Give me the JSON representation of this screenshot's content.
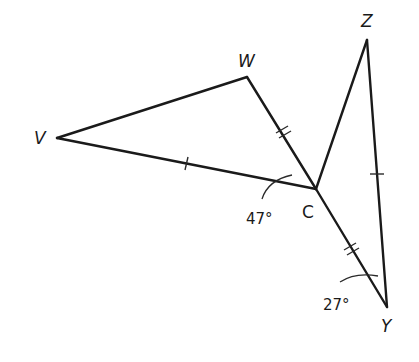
{
  "diagram": {
    "points": {
      "V": {
        "label": "V",
        "x": 57,
        "y": 138,
        "italic": true
      },
      "W": {
        "label": "W",
        "x": 247,
        "y": 77,
        "italic": true
      },
      "C": {
        "label": "C",
        "x": 316,
        "y": 189,
        "italic": false
      },
      "Z": {
        "label": "Z",
        "x": 367,
        "y": 40,
        "italic": true
      },
      "Y": {
        "label": "Y",
        "x": 387,
        "y": 307,
        "italic": true
      }
    },
    "segments": [
      {
        "from": "V",
        "to": "W",
        "ticks": 0
      },
      {
        "from": "W",
        "to": "C",
        "ticks": 2
      },
      {
        "from": "V",
        "to": "C",
        "ticks": 1
      },
      {
        "from": "C",
        "to": "Z",
        "ticks": 0
      },
      {
        "from": "Z",
        "to": "Y",
        "ticks": 1
      },
      {
        "from": "C",
        "to": "Y",
        "ticks": 2
      }
    ],
    "angles": [
      {
        "vertex": "C",
        "between": [
          "V",
          "W"
        ],
        "label": "47°"
      },
      {
        "vertex": "Y",
        "between": [
          "C",
          "Z"
        ],
        "label": "27°"
      }
    ],
    "labels": {
      "V": "V",
      "W": "W",
      "C": "C",
      "Z": "Z",
      "Y": "Y",
      "angle_C": "47°",
      "angle_Y": "27°"
    },
    "colors": {
      "line": "#1a1a1a",
      "background": "#ffffff"
    }
  }
}
